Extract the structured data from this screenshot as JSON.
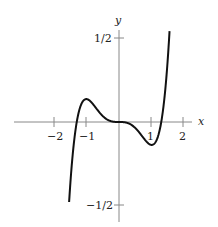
{
  "chart_data": {
    "type": "line",
    "title": "",
    "xlabel": "x",
    "ylabel": "y",
    "xlim": [
      -2.8,
      2.8
    ],
    "ylim": [
      -0.6,
      0.6
    ],
    "grid": false,
    "legend": null,
    "x_ticks": [
      {
        "value": -2,
        "label": "−2"
      },
      {
        "value": -1,
        "label": "−1"
      },
      {
        "value": 1,
        "label": "1"
      },
      {
        "value": 2,
        "label": "2"
      }
    ],
    "y_ticks": [
      {
        "value": 0.5,
        "label": "1/2"
      },
      {
        "value": -0.5,
        "label": "−1/2"
      }
    ],
    "function": "y = 0.2 x^3 (x^2 - 1.69)",
    "series": [
      {
        "name": "curve",
        "x": [
          -1.55,
          -1.5,
          -1.45,
          -1.4,
          -1.35,
          -1.3,
          -1.2,
          -1.1,
          -1.0,
          -0.9,
          -0.8,
          -0.6,
          -0.4,
          -0.2,
          0,
          0.2,
          0.4,
          0.6,
          0.8,
          0.9,
          1.0,
          1.1,
          1.2,
          1.3,
          1.35,
          1.4,
          1.45,
          1.5,
          1.55,
          1.6
        ],
        "y": [
          -0.502,
          -0.378,
          -0.275,
          -0.168,
          -0.095,
          -0.001,
          0.131,
          0.128,
          0.138,
          0.128,
          0.105,
          0.056,
          0.02,
          0.003,
          0,
          -0.003,
          -0.02,
          -0.056,
          -0.105,
          -0.128,
          -0.138,
          -0.128,
          -0.131,
          0.001,
          0.095,
          0.168,
          0.275,
          0.378,
          0.502,
          0.639
        ]
      }
    ],
    "colors": {
      "curve": "#111111",
      "axes": "#888888",
      "text": "#222222"
    }
  },
  "labels": {
    "x_axis": "x",
    "y_axis": "y",
    "tick_x_m2": "−2",
    "tick_x_m1": "−1",
    "tick_x_1": "1",
    "tick_x_2": "2",
    "tick_y_half": "1/2",
    "tick_y_mhalf": "−1/2"
  }
}
